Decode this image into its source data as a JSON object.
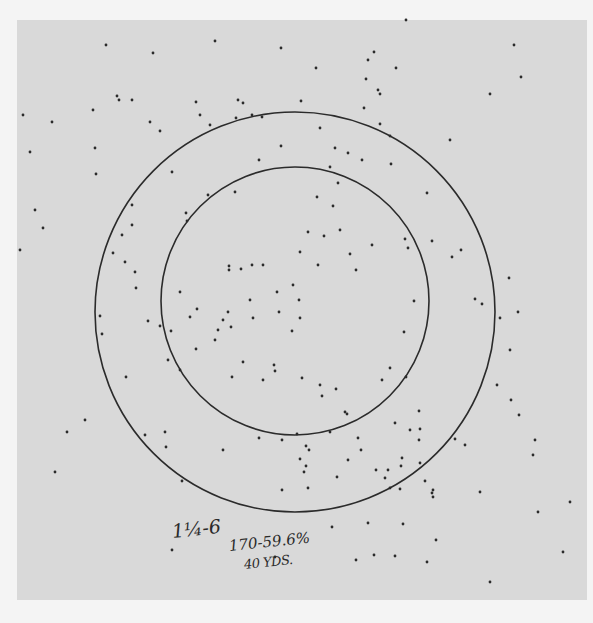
{
  "sheet": {
    "background": "#f4f4f4",
    "paper_color": "#d9d9d9",
    "ink_color": "#2b2b2b",
    "paper": {
      "x": 17,
      "y": 20,
      "w": 570,
      "h": 580
    }
  },
  "circles": [
    {
      "name": "outer-circle",
      "cx": 295,
      "cy": 312,
      "r": 200
    },
    {
      "name": "inner-circle",
      "cx": 295,
      "cy": 301,
      "r": 134
    }
  ],
  "annotation": {
    "load": "1¼-6",
    "hits": "170-59.6%",
    "distance": "40 YDS."
  },
  "pellets": [
    [
      106,
      45
    ],
    [
      153,
      53
    ],
    [
      215,
      41
    ],
    [
      281,
      48
    ],
    [
      406,
      20
    ],
    [
      374,
      52
    ],
    [
      368,
      60
    ],
    [
      396,
      68
    ],
    [
      514,
      45
    ],
    [
      521,
      77
    ],
    [
      490,
      94
    ],
    [
      23,
      115
    ],
    [
      52,
      122
    ],
    [
      93,
      110
    ],
    [
      117,
      96
    ],
    [
      119,
      100
    ],
    [
      132,
      100
    ],
    [
      160,
      131
    ],
    [
      150,
      122
    ],
    [
      196,
      102
    ],
    [
      200,
      115
    ],
    [
      238,
      100
    ],
    [
      243,
      103
    ],
    [
      236,
      118
    ],
    [
      252,
      115
    ],
    [
      262,
      117
    ],
    [
      281,
      146
    ],
    [
      210,
      125
    ],
    [
      172,
      172
    ],
    [
      95,
      148
    ],
    [
      96,
      174
    ],
    [
      30,
      152
    ],
    [
      20,
      250
    ],
    [
      35,
      210
    ],
    [
      43,
      228
    ],
    [
      316,
      68
    ],
    [
      366,
      79
    ],
    [
      378,
      90
    ],
    [
      380,
      94
    ],
    [
      364,
      108
    ],
    [
      390,
      136
    ],
    [
      320,
      128
    ],
    [
      450,
      140
    ],
    [
      461,
      250
    ],
    [
      301,
      101
    ],
    [
      380,
      124
    ],
    [
      330,
      167
    ],
    [
      348,
      153
    ],
    [
      362,
      160
    ],
    [
      427,
      193
    ],
    [
      391,
      164
    ],
    [
      335,
      148
    ],
    [
      338,
      183
    ],
    [
      317,
      197
    ],
    [
      333,
      206
    ],
    [
      259,
      160
    ],
    [
      235,
      192
    ],
    [
      208,
      195
    ],
    [
      186,
      213
    ],
    [
      187,
      221
    ],
    [
      132,
      205
    ],
    [
      132,
      225
    ],
    [
      122,
      235
    ],
    [
      113,
      253
    ],
    [
      125,
      262
    ],
    [
      135,
      272
    ],
    [
      136,
      288
    ],
    [
      160,
      326
    ],
    [
      148,
      321
    ],
    [
      126,
      377
    ],
    [
      100,
      316
    ],
    [
      102,
      334
    ],
    [
      308,
      232
    ],
    [
      324,
      236
    ],
    [
      340,
      230
    ],
    [
      350,
      254
    ],
    [
      372,
      245
    ],
    [
      356,
      270
    ],
    [
      300,
      252
    ],
    [
      318,
      265
    ],
    [
      252,
      265
    ],
    [
      241,
      269
    ],
    [
      229,
      266
    ],
    [
      229,
      270
    ],
    [
      263,
      265
    ],
    [
      277,
      292
    ],
    [
      293,
      285
    ],
    [
      279,
      312
    ],
    [
      300,
      318
    ],
    [
      292,
      331
    ],
    [
      299,
      300
    ],
    [
      253,
      318
    ],
    [
      250,
      300
    ],
    [
      180,
      292
    ],
    [
      197,
      309
    ],
    [
      190,
      317
    ],
    [
      228,
      312
    ],
    [
      223,
      320
    ],
    [
      231,
      327
    ],
    [
      218,
      330
    ],
    [
      215,
      340
    ],
    [
      196,
      349
    ],
    [
      171,
      331
    ],
    [
      168,
      360
    ],
    [
      180,
      370
    ],
    [
      243,
      362
    ],
    [
      232,
      377
    ],
    [
      274,
      365
    ],
    [
      275,
      371
    ],
    [
      263,
      380
    ],
    [
      302,
      378
    ],
    [
      320,
      385
    ],
    [
      336,
      389
    ],
    [
      345,
      412
    ],
    [
      322,
      396
    ],
    [
      347,
      414
    ],
    [
      390,
      368
    ],
    [
      406,
      377
    ],
    [
      419,
      411
    ],
    [
      395,
      423
    ],
    [
      330,
      432
    ],
    [
      358,
      438
    ],
    [
      382,
      380
    ],
    [
      404,
      332
    ],
    [
      414,
      301
    ],
    [
      408,
      248
    ],
    [
      405,
      239
    ],
    [
      432,
      241
    ],
    [
      452,
      257
    ],
    [
      475,
      299
    ],
    [
      509,
      278
    ],
    [
      518,
      312
    ],
    [
      482,
      304
    ],
    [
      500,
      318
    ],
    [
      510,
      350
    ],
    [
      497,
      385
    ],
    [
      511,
      400
    ],
    [
      519,
      415
    ],
    [
      465,
      445
    ],
    [
      420,
      429
    ],
    [
      410,
      430
    ],
    [
      361,
      450
    ],
    [
      306,
      446
    ],
    [
      259,
      438
    ],
    [
      282,
      440
    ],
    [
      297,
      434
    ],
    [
      300,
      459
    ],
    [
      304,
      472
    ],
    [
      282,
      490
    ],
    [
      308,
      488
    ],
    [
      337,
      477
    ],
    [
      348,
      460
    ],
    [
      388,
      470
    ],
    [
      401,
      466
    ],
    [
      376,
      470
    ],
    [
      385,
      478
    ],
    [
      402,
      458
    ],
    [
      420,
      463
    ],
    [
      425,
      481
    ],
    [
      433,
      497
    ],
    [
      419,
      440
    ],
    [
      455,
      439
    ],
    [
      432,
      493
    ],
    [
      85,
      420
    ],
    [
      67,
      432
    ],
    [
      55,
      472
    ],
    [
      165,
      432
    ],
    [
      145,
      435
    ],
    [
      166,
      447
    ],
    [
      182,
      481
    ],
    [
      172,
      550
    ],
    [
      223,
      450
    ],
    [
      368,
      523
    ],
    [
      356,
      560
    ],
    [
      403,
      524
    ],
    [
      395,
      556
    ],
    [
      374,
      555
    ],
    [
      433,
      490
    ],
    [
      480,
      492
    ],
    [
      535,
      440
    ],
    [
      533,
      455
    ],
    [
      570,
      502
    ],
    [
      538,
      512
    ],
    [
      563,
      552
    ],
    [
      490,
      582
    ],
    [
      436,
      540
    ],
    [
      427,
      562
    ],
    [
      275,
      557
    ],
    [
      332,
      527
    ],
    [
      309,
      450
    ],
    [
      306,
      466
    ],
    [
      390,
      488
    ],
    [
      400,
      489
    ]
  ]
}
